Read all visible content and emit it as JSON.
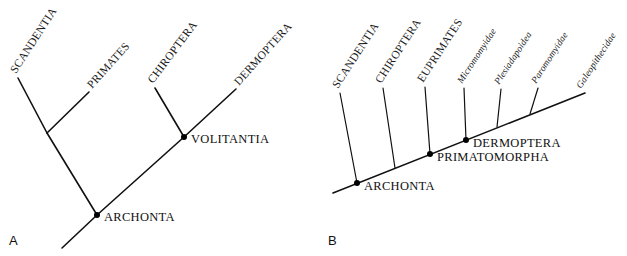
{
  "figure": {
    "background_color": "#ffffff",
    "line_color": "#111111"
  },
  "panels": [
    {
      "letter": "A",
      "type": "cladogram",
      "tips": [
        {
          "name": "SCANDENTIA",
          "label": "SCANDENTIA"
        },
        {
          "name": "PRIMATES",
          "label": "PRIMATES"
        },
        {
          "name": "CHIROPTERA",
          "label": "CHIROPTERA"
        },
        {
          "name": "DERMOPTERA",
          "label": "DERMOPTERA"
        }
      ],
      "nodes": [
        {
          "name": "ARCHONTA",
          "label": "ARCHONTA"
        },
        {
          "name": "VOLITANTIA",
          "label": "VOLITANTIA"
        }
      ]
    },
    {
      "letter": "B",
      "type": "cladogram",
      "tips": [
        {
          "name": "SCANDENTIA",
          "label": "SCANDENTIA",
          "style": "caps"
        },
        {
          "name": "CHIROPTERA",
          "label": "CHIROPTERA",
          "style": "caps"
        },
        {
          "name": "EUPRIMATES",
          "label": "EUPRIMATES",
          "style": "caps"
        },
        {
          "name": "Micromomyidae",
          "label": "Micromomyidae",
          "style": "italic"
        },
        {
          "name": "Plesiadapoidea",
          "label": "Plesiadapoidea",
          "style": "italic"
        },
        {
          "name": "Paromomyidae",
          "label": "Paromomyidae",
          "style": "italic"
        },
        {
          "name": "Galeopithecidae",
          "label": "Galeopithecidae",
          "style": "italic"
        }
      ],
      "nodes": [
        {
          "name": "ARCHONTA",
          "label": "ARCHONTA"
        },
        {
          "name": "PRIMATOMORPHA",
          "label": "PRIMATOMORPHA"
        },
        {
          "name": "DERMOPTERA",
          "label": "DERMOPTERA"
        }
      ]
    }
  ]
}
